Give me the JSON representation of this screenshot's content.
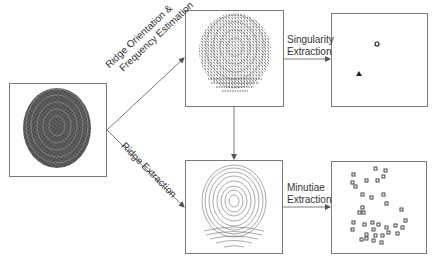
{
  "diagram": {
    "nodes": [
      {
        "id": "input",
        "description": "Input fingerprint image"
      },
      {
        "id": "orientation",
        "description": "Ridge orientation field"
      },
      {
        "id": "ridges",
        "description": "Thinned ridge image"
      },
      {
        "id": "singularities",
        "description": "Singular points"
      },
      {
        "id": "minutiae",
        "description": "Minutiae points"
      }
    ],
    "edges": [
      {
        "from": "input",
        "to": "orientation",
        "label_line1": "Ridge Orientation &",
        "label_line2": "Frequency Estimation"
      },
      {
        "from": "input",
        "to": "ridges",
        "label": "Ridge Extraction"
      },
      {
        "from": "orientation",
        "to": "ridges",
        "label": ""
      },
      {
        "from": "orientation",
        "to": "singularities",
        "label_line1": "Singularity",
        "label_line2": "Extraction"
      },
      {
        "from": "ridges",
        "to": "minutiae",
        "label_line1": "Minutiae",
        "label_line2": "Extraction"
      }
    ]
  },
  "colors": {
    "line": "#7a7a7a",
    "text": "#333333",
    "ink": "#1a1a1a"
  }
}
